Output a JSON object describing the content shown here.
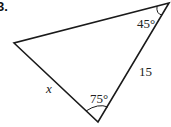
{
  "problem": {
    "number": "3."
  },
  "diagram": {
    "type": "triangle",
    "vertices": {
      "top_right": [
        169,
        3
      ],
      "left": [
        14,
        43
      ],
      "bottom": [
        98,
        122
      ]
    },
    "labels": {
      "angle_top_right": "45°",
      "angle_bottom": "75°",
      "side_right": "15",
      "side_left": "x"
    },
    "stroke_color": "#1a1a1a"
  }
}
